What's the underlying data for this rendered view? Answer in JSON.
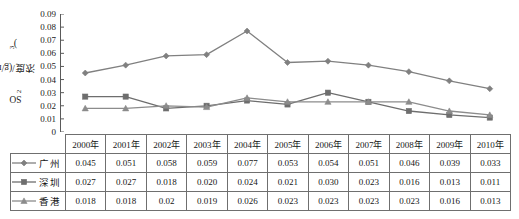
{
  "chart_data": {
    "type": "line",
    "title": "",
    "xlabel": "",
    "ylabel": "SO2浓度/(g/m3)",
    "ylabel_parts": {
      "prefix": "SO",
      "sub": "2",
      "middle": "浓度/(g/m",
      "sup": "3",
      "suffix": ")"
    },
    "categories": [
      "2000年",
      "2001年",
      "2002年",
      "2003年",
      "2004年",
      "2005年",
      "2006年",
      "2007年",
      "2008年",
      "2009年",
      "2010年"
    ],
    "ylim": [
      0,
      0.09
    ],
    "yticks": [
      "0",
      "0.01",
      "0.02",
      "0.03",
      "0.04",
      "0.05",
      "0.06",
      "0.07",
      "0.08",
      "0.09"
    ],
    "ytick_values": [
      0,
      0.01,
      0.02,
      0.03,
      0.04,
      0.05,
      0.06,
      0.07,
      0.08,
      0.09
    ],
    "grid": false,
    "legend_position": "table-first-column",
    "series": [
      {
        "name": "广州",
        "marker": "diamond",
        "color": "#808080",
        "values": [
          0.045,
          0.051,
          0.058,
          0.059,
          0.077,
          0.053,
          0.054,
          0.051,
          0.046,
          0.039,
          0.033
        ],
        "labels": [
          "0.045",
          "0.051",
          "0.058",
          "0.059",
          "0.077",
          "0.053",
          "0.054",
          "0.051",
          "0.046",
          "0.039",
          "0.033"
        ]
      },
      {
        "name": "深圳",
        "marker": "square",
        "color": "#6e6e6e",
        "values": [
          0.027,
          0.027,
          0.018,
          0.02,
          0.024,
          0.021,
          0.03,
          0.023,
          0.016,
          0.013,
          0.011
        ],
        "labels": [
          "0.027",
          "0.027",
          "0.018",
          "0.020",
          "0.024",
          "0.021",
          "0.030",
          "0.023",
          "0.016",
          "0.013",
          "0.011"
        ]
      },
      {
        "name": "香港",
        "marker": "triangle",
        "color": "#8c8c8c",
        "values": [
          0.018,
          0.018,
          0.02,
          0.019,
          0.026,
          0.023,
          0.023,
          0.023,
          0.023,
          0.016,
          0.013
        ],
        "labels": [
          "0.018",
          "0.018",
          "0.02",
          "0.019",
          "0.026",
          "0.023",
          "0.023",
          "0.023",
          "0.023",
          "0.016",
          "0.013"
        ]
      }
    ]
  },
  "table": {
    "corner_label": "",
    "columns": [
      "2000年",
      "2001年",
      "2002年",
      "2003年",
      "2004年",
      "2005年",
      "2006年",
      "2007年",
      "2008年",
      "2009年",
      "2010年"
    ],
    "rows": [
      {
        "label": "广州",
        "marker": "diamond",
        "cells": [
          "0.045",
          "0.051",
          "0.058",
          "0.059",
          "0.077",
          "0.053",
          "0.054",
          "0.051",
          "0.046",
          "0.039",
          "0.033"
        ]
      },
      {
        "label": "深圳",
        "marker": "square",
        "cells": [
          "0.027",
          "0.027",
          "0.018",
          "0.020",
          "0.024",
          "0.021",
          "0.030",
          "0.023",
          "0.016",
          "0.013",
          "0.011"
        ]
      },
      {
        "label": "香港",
        "marker": "triangle",
        "cells": [
          "0.018",
          "0.018",
          "0.02",
          "0.019",
          "0.026",
          "0.023",
          "0.023",
          "0.023",
          "0.023",
          "0.016",
          "0.013"
        ]
      }
    ]
  },
  "colors": {
    "axis": "#5a5a5a",
    "line_guangzhou": "#808080",
    "line_shenzhen": "#6e6e6e",
    "line_hongkong": "#8c8c8c",
    "table_border": "#6f6f6f",
    "text": "#161616"
  }
}
